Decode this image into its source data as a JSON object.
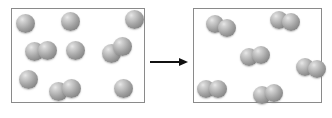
{
  "diagram": {
    "background_color": "#ffffff",
    "atom_color": "#a8a8a8",
    "atom_highlight_color": "#e8e8e8",
    "atom_shadow_color": "#7c7c7c",
    "border_color": "#8a8a8a",
    "arrow_color": "#111111",
    "atom_diameter": 18
  },
  "boxes": [
    {
      "name": "reactant-container",
      "label": "Reactants",
      "x": 11,
      "y": 8,
      "width": 134,
      "height": 95
    },
    {
      "name": "product-container",
      "label": "Products",
      "x": 193,
      "y": 8,
      "width": 129,
      "height": 95
    }
  ],
  "arrow": {
    "name": "reaction-arrow",
    "label": "reacts to form",
    "x": 150,
    "y": 61,
    "length": 38,
    "direction": "right"
  },
  "reactants": {
    "single_atom_count": 6,
    "molecule_count": 3,
    "atoms": [
      {
        "id": "r-a1",
        "cx": 25,
        "cy": 23,
        "d": 19
      },
      {
        "id": "r-a2",
        "cx": 70,
        "cy": 21,
        "d": 19
      },
      {
        "id": "r-a3",
        "cx": 134,
        "cy": 19,
        "d": 19
      },
      {
        "id": "r-a4",
        "cx": 75,
        "cy": 50,
        "d": 19
      },
      {
        "id": "r-a5",
        "cx": 28,
        "cy": 79,
        "d": 19
      },
      {
        "id": "r-a6",
        "cx": 123,
        "cy": 88,
        "d": 19
      }
    ],
    "molecules": [
      {
        "id": "r-m1",
        "cx": 41,
        "cy": 51,
        "d": 19,
        "gap": 13,
        "angle": -6
      },
      {
        "id": "r-m2",
        "cx": 117,
        "cy": 50,
        "d": 19,
        "gap": 13,
        "angle": -28
      },
      {
        "id": "r-m3",
        "cx": 65,
        "cy": 90,
        "d": 19,
        "gap": 13,
        "angle": -10
      }
    ]
  },
  "products": {
    "single_atom_count": 0,
    "molecule_count": 7,
    "atoms": [],
    "molecules": [
      {
        "id": "p-m1",
        "cx": 221,
        "cy": 26,
        "d": 18,
        "gap": 12,
        "angle": 18
      },
      {
        "id": "p-m2",
        "cx": 285,
        "cy": 21,
        "d": 18,
        "gap": 12,
        "angle": 8
      },
      {
        "id": "p-m3",
        "cx": 255,
        "cy": 56,
        "d": 18,
        "gap": 12,
        "angle": -12
      },
      {
        "id": "p-m4",
        "cx": 311,
        "cy": 68,
        "d": 18,
        "gap": 12,
        "angle": 12
      },
      {
        "id": "p-m5",
        "cx": 212,
        "cy": 89,
        "d": 18,
        "gap": 12,
        "angle": -4
      },
      {
        "id": "p-m6",
        "cx": 268,
        "cy": 94,
        "d": 18,
        "gap": 12,
        "angle": -8
      }
    ]
  }
}
